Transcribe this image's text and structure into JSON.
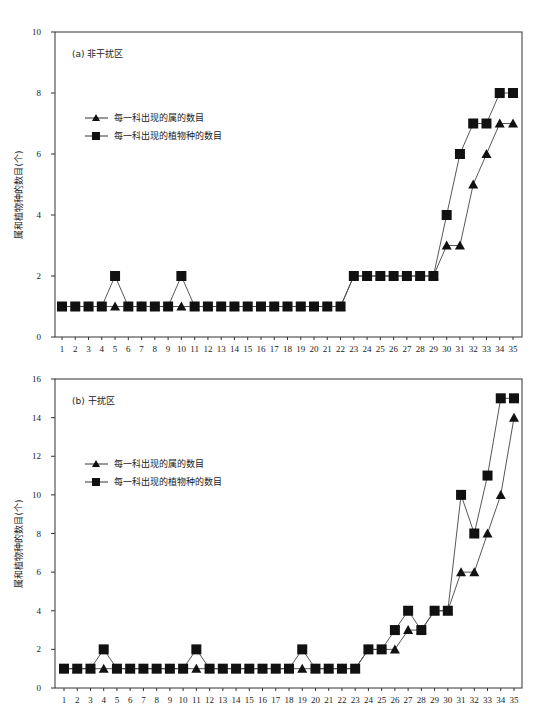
{
  "chart_data": [
    {
      "type": "line",
      "title": "(a) 非干扰区",
      "xlabel": "",
      "ylabel": "属和植物种的数目(个)",
      "ylim": [
        0,
        10
      ],
      "yticks": [
        0,
        2,
        4,
        6,
        8,
        10
      ],
      "grid": false,
      "legend_position": "upper-left",
      "x": [
        1,
        2,
        3,
        4,
        5,
        6,
        7,
        8,
        9,
        10,
        11,
        12,
        13,
        14,
        15,
        16,
        17,
        18,
        19,
        20,
        21,
        22,
        23,
        24,
        25,
        26,
        27,
        28,
        29,
        30,
        31,
        32,
        33,
        34,
        35
      ],
      "series": [
        {
          "name": "每一科出现的属的数目",
          "marker": "triangle",
          "values": [
            1,
            1,
            1,
            1,
            1,
            1,
            1,
            1,
            1,
            1,
            1,
            1,
            1,
            1,
            1,
            1,
            1,
            1,
            1,
            1,
            1,
            1,
            2,
            2,
            2,
            2,
            2,
            2,
            2,
            3,
            3,
            5,
            6,
            7,
            7
          ]
        },
        {
          "name": "每一科出现的植物种的数目",
          "marker": "square",
          "values": [
            1,
            1,
            1,
            1,
            2,
            1,
            1,
            1,
            1,
            2,
            1,
            1,
            1,
            1,
            1,
            1,
            1,
            1,
            1,
            1,
            1,
            1,
            2,
            2,
            2,
            2,
            2,
            2,
            2,
            4,
            6,
            7,
            7,
            8,
            8
          ]
        }
      ]
    },
    {
      "type": "line",
      "title": "(b) 干扰区",
      "xlabel": "",
      "ylabel": "属和植物种的数目(个)",
      "ylim": [
        0,
        16
      ],
      "yticks": [
        0,
        2,
        4,
        6,
        8,
        10,
        12,
        14,
        16
      ],
      "grid": false,
      "legend_position": "upper-left",
      "x": [
        1,
        2,
        3,
        4,
        5,
        6,
        7,
        8,
        9,
        10,
        11,
        12,
        13,
        14,
        15,
        16,
        17,
        18,
        19,
        20,
        21,
        22,
        23,
        24,
        25,
        26,
        27,
        28,
        29,
        30,
        31,
        32,
        33,
        34,
        35
      ],
      "series": [
        {
          "name": "每一科出现的属的数目",
          "marker": "triangle",
          "values": [
            1,
            1,
            1,
            1,
            1,
            1,
            1,
            1,
            1,
            1,
            1,
            1,
            1,
            1,
            1,
            1,
            1,
            1,
            1,
            1,
            1,
            1,
            1,
            2,
            2,
            2,
            3,
            3,
            4,
            4,
            6,
            6,
            8,
            10,
            14
          ]
        },
        {
          "name": "每一科出现的植物种的数目",
          "marker": "square",
          "values": [
            1,
            1,
            1,
            2,
            1,
            1,
            1,
            1,
            1,
            1,
            2,
            1,
            1,
            1,
            1,
            1,
            1,
            1,
            2,
            1,
            1,
            1,
            1,
            2,
            2,
            3,
            4,
            3,
            4,
            4,
            10,
            8,
            11,
            15,
            15
          ]
        }
      ]
    }
  ],
  "layout": [
    {
      "top": 0,
      "height": 360,
      "plot": {
        "left": 55,
        "right": 522,
        "top": 32,
        "bottom": 337
      },
      "x_first_px": 62,
      "x_last_px": 513
    },
    {
      "top": 360,
      "height": 346,
      "plot": {
        "left": 55,
        "right": 522,
        "top": 19,
        "bottom": 328
      },
      "x_first_px": 64,
      "x_last_px": 514
    }
  ]
}
